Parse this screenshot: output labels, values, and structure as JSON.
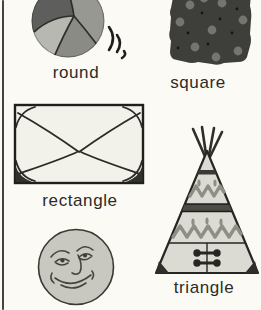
{
  "page": {
    "type": "shapes primer page",
    "background_color": "#fbfaf4",
    "edge_line_color": "#45453f",
    "text_color": "#2b2b28"
  },
  "figures": {
    "ball": {
      "name": "beach-ball",
      "label": "round"
    },
    "cookie": {
      "name": "dotted-cookie",
      "label": "square"
    },
    "envelope": {
      "name": "envelope",
      "label": "rectangle"
    },
    "moon": {
      "name": "moon-face",
      "label": ""
    },
    "teepee": {
      "name": "teepee",
      "label": "triangle"
    }
  },
  "colors": {
    "outline": "#262622",
    "seam": "#2d2d2a",
    "ball_dark": "#5e5e5c",
    "ball_mid": "#989893",
    "ball_bottom": "#8b8b86",
    "ball_light": "#b8b8b2",
    "cookie_fill": "#3e3e3b",
    "cookie_chip": "#75756f",
    "envelope_fill": "#f2f1ea",
    "moon_fill": "#c8c7c0",
    "teepee_fill": "#dcdbd3",
    "teepee_band": "#4c4c47",
    "teepee_zigzag": "#8e8e87"
  }
}
